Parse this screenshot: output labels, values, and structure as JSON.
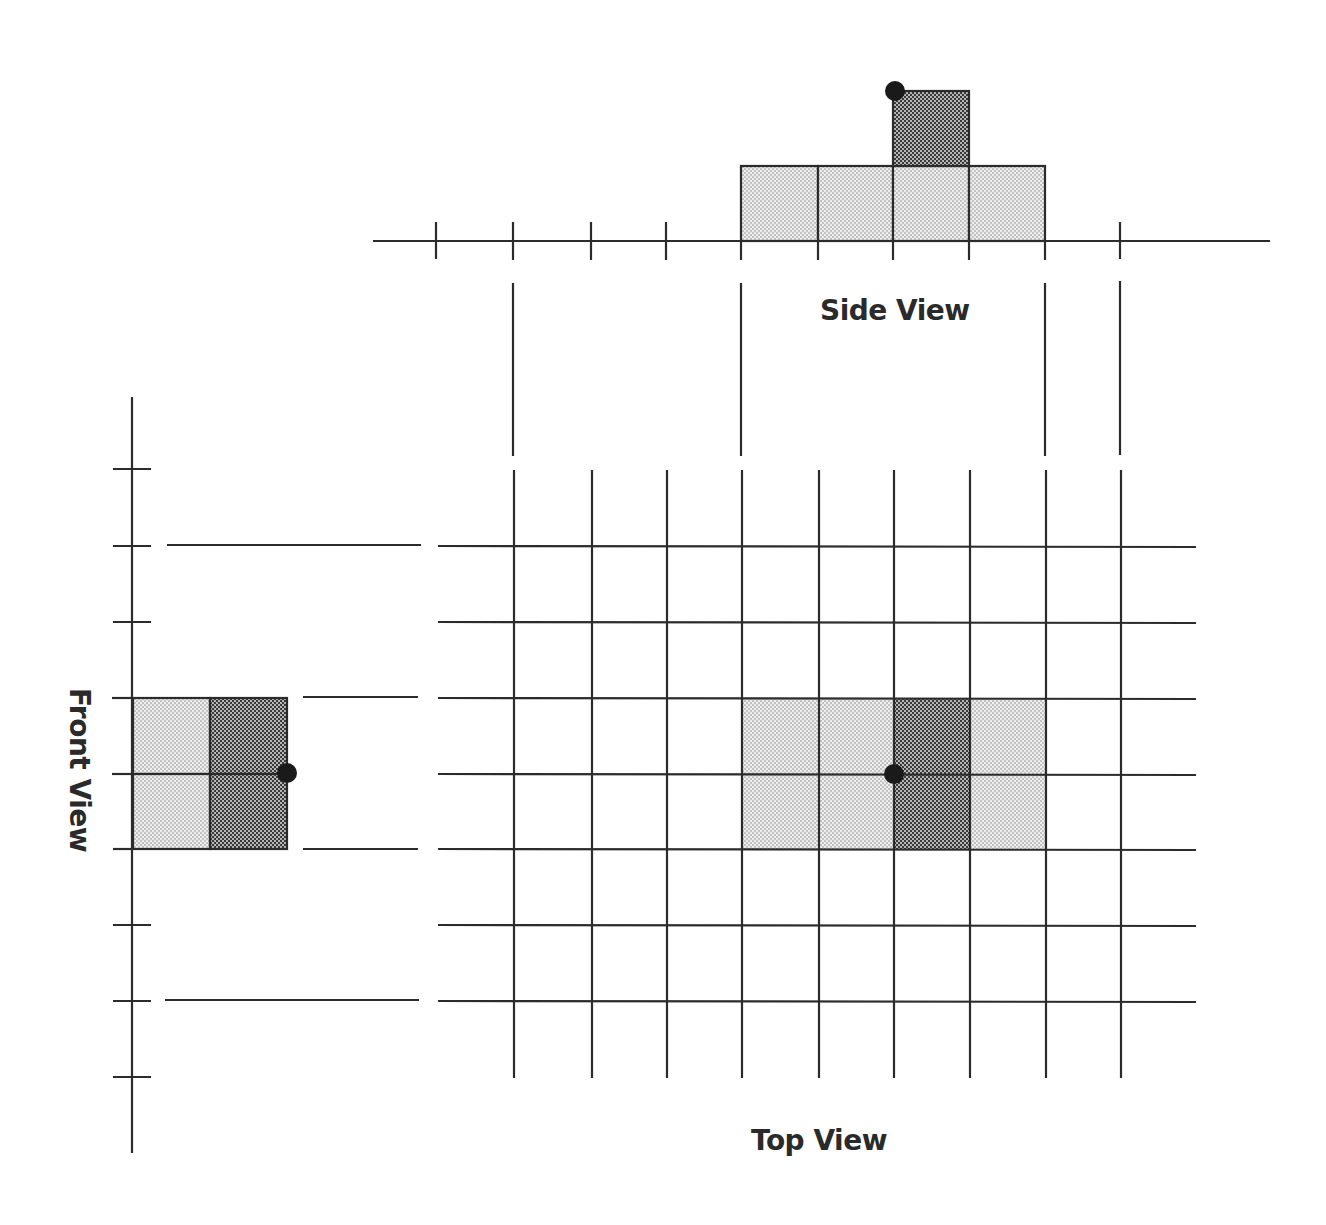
{
  "labels": {
    "side_view": "Side View",
    "top_view": "Top View",
    "front_view": "Front View"
  },
  "colors": {
    "line": "#2b2b2b",
    "light_fill": "#d6d6d6",
    "dark_fill": "#6e6e6e",
    "dot": "#1a1a1a",
    "background": "#ffffff"
  },
  "grid": {
    "columns": 8,
    "rows": 6,
    "cell_size_px": 76
  },
  "side_view": {
    "baseline_ticks": 10,
    "light_cells": 4,
    "dark_cells": 1,
    "light_cell_columns": [
      4,
      5,
      6,
      7
    ],
    "dark_cell_column": 6,
    "dark_cell_level": 2,
    "marker_dot": "top-left corner of dark cell"
  },
  "top_view": {
    "light_cells": [
      [
        4,
        2
      ],
      [
        5,
        2
      ],
      [
        7,
        2
      ],
      [
        4,
        3
      ],
      [
        5,
        3
      ],
      [
        7,
        3
      ]
    ],
    "dark_cells": [
      [
        6,
        2
      ],
      [
        6,
        3
      ]
    ],
    "marker_dot": "grid intersection at column 6, row 3"
  },
  "front_view": {
    "axis_ticks": 9,
    "light_cells": 2,
    "dark_cells": 2,
    "marker_dot": "right edge midpoint of dark cells"
  }
}
